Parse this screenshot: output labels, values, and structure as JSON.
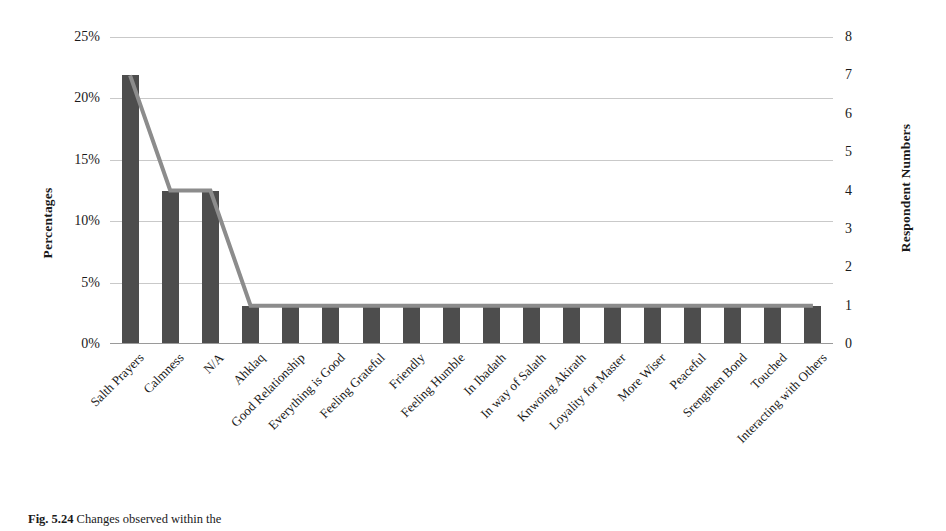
{
  "chart_data": {
    "type": "bar",
    "title": "",
    "xlabel": "",
    "ylabel": "Percentages",
    "y2label": "Respondent Numbers",
    "grid": true,
    "legend": "none",
    "ylim": [
      0,
      25
    ],
    "y2lim": [
      0,
      8
    ],
    "yticks": [
      "0%",
      "5%",
      "10%",
      "15%",
      "20%",
      "25%"
    ],
    "ytick_values": [
      0,
      5,
      10,
      15,
      20,
      25
    ],
    "y2ticks": [
      "0",
      "1",
      "2",
      "3",
      "4",
      "5",
      "6",
      "7",
      "8"
    ],
    "y2tick_values": [
      0,
      1,
      2,
      3,
      4,
      5,
      6,
      7,
      8
    ],
    "gridline_values": [
      5,
      10,
      15,
      20,
      25
    ],
    "categories": [
      "Salth Prayers",
      "Calmness",
      "N/A",
      "Ahklaq",
      "Good Relationship",
      "Everything is Good",
      "Feeling Grateful",
      "Friendly",
      "Feeling Humble",
      "In Ibadath",
      "In way of Salath",
      "Knwoing Akirath",
      "Loyality for Master",
      "More Wiser",
      "Peaceful",
      "Srengthen Bond",
      "Touched",
      "Interacting with Others"
    ],
    "series": [
      {
        "name": "Percentages",
        "kind": "bar",
        "values": [
          21.9,
          12.5,
          12.5,
          3.1,
          3.1,
          3.1,
          3.1,
          3.1,
          3.1,
          3.1,
          3.1,
          3.1,
          3.1,
          3.1,
          3.1,
          3.1,
          3.1,
          3.1
        ],
        "color": "#4d4d4d"
      },
      {
        "name": "Respondent Numbers",
        "kind": "line",
        "axis": "secondary",
        "values": [
          7,
          4,
          4,
          1,
          1,
          1,
          1,
          1,
          1,
          1,
          1,
          1,
          1,
          1,
          1,
          1,
          1,
          1
        ],
        "color": "#8c8c8c"
      }
    ]
  },
  "caption": {
    "label": "Fig. 5.24",
    "text": "Changes observed within the"
  }
}
